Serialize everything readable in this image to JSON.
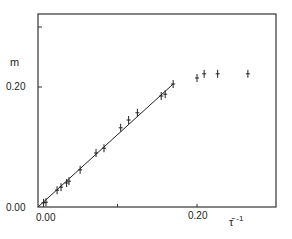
{
  "chart_data": {
    "type": "scatter",
    "title": "",
    "xlabel": "τ̄ ⁻¹",
    "ylabel": "m",
    "xlim": [
      0.0,
      0.3
    ],
    "ylim": [
      0.0,
      0.32
    ],
    "x_ticks": [
      0.0,
      0.1,
      0.2
    ],
    "x_tick_labels": [
      "0.00",
      "",
      "0.20"
    ],
    "y_ticks": [
      0.0,
      0.2,
      0.3
    ],
    "y_tick_labels": [
      "0.00",
      "0.20",
      ""
    ],
    "grid": false,
    "legend": null,
    "series": [
      {
        "name": "data",
        "marker": "+",
        "points": [
          [
            0.007,
            0.007
          ],
          [
            0.01,
            0.008
          ],
          [
            0.024,
            0.028
          ],
          [
            0.029,
            0.033
          ],
          [
            0.036,
            0.04
          ],
          [
            0.039,
            0.043
          ],
          [
            0.053,
            0.062
          ],
          [
            0.073,
            0.09
          ],
          [
            0.083,
            0.098
          ],
          [
            0.104,
            0.132
          ],
          [
            0.114,
            0.145
          ],
          [
            0.125,
            0.157
          ],
          [
            0.155,
            0.185
          ],
          [
            0.16,
            0.188
          ],
          [
            0.17,
            0.205
          ],
          [
            0.2,
            0.215
          ],
          [
            0.209,
            0.222
          ],
          [
            0.226,
            0.222
          ],
          [
            0.264,
            0.222
          ]
        ]
      },
      {
        "name": "linear fit",
        "type": "line",
        "points": [
          [
            0.0,
            0.0
          ],
          [
            0.17,
            0.205
          ]
        ]
      }
    ]
  },
  "labels": {
    "y_axis": "m",
    "x_axis": "τ̄",
    "x_axis_sup": "-1",
    "y_tick_0": "0.00",
    "y_tick_020": "0.20",
    "x_tick_0": "0.00",
    "x_tick_020": "0.20"
  }
}
